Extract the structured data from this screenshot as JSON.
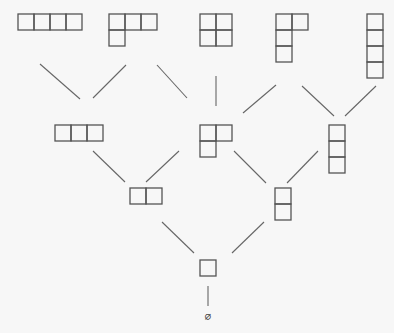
{
  "diagram": {
    "cell_size": 16,
    "colors": {
      "background": "#f7f7f7",
      "cell_stroke": "#555555",
      "edge_stroke": "#666666"
    },
    "nodes": [
      {
        "id": "p4",
        "partition": [
          4
        ],
        "label": "(4)",
        "x": 18,
        "y": 14
      },
      {
        "id": "p31",
        "partition": [
          3,
          1
        ],
        "label": "(3,1)",
        "x": 109,
        "y": 14
      },
      {
        "id": "p22",
        "partition": [
          2,
          2
        ],
        "label": "(2,2)",
        "x": 200,
        "y": 14
      },
      {
        "id": "p211",
        "partition": [
          2,
          1,
          1
        ],
        "label": "(2,1,1)",
        "x": 276,
        "y": 14
      },
      {
        "id": "p1111",
        "partition": [
          1,
          1,
          1,
          1
        ],
        "label": "(1,1,1,1)",
        "x": 367,
        "y": 14
      },
      {
        "id": "p3",
        "partition": [
          3
        ],
        "label": "(3)",
        "x": 55,
        "y": 125
      },
      {
        "id": "p21",
        "partition": [
          2,
          1
        ],
        "label": "(2,1)",
        "x": 200,
        "y": 125
      },
      {
        "id": "p111",
        "partition": [
          1,
          1,
          1
        ],
        "label": "(1,1,1)",
        "x": 329,
        "y": 125
      },
      {
        "id": "p2",
        "partition": [
          2
        ],
        "label": "(2)",
        "x": 130,
        "y": 188
      },
      {
        "id": "p11",
        "partition": [
          1,
          1
        ],
        "label": "(1,1)",
        "x": 275,
        "y": 188
      },
      {
        "id": "p1",
        "partition": [
          1
        ],
        "label": "(1)",
        "x": 200,
        "y": 260
      }
    ],
    "edges": [
      {
        "from": "p3",
        "to": "p4",
        "x1": 80,
        "y1": 99,
        "x2": 40,
        "y2": 64
      },
      {
        "from": "p3",
        "to": "p31",
        "x1": 93,
        "y1": 98,
        "x2": 126,
        "y2": 65
      },
      {
        "from": "p21",
        "to": "p31",
        "x1": 187,
        "y1": 98,
        "x2": 157,
        "y2": 65
      },
      {
        "from": "p21",
        "to": "p22",
        "x1": 216,
        "y1": 106,
        "x2": 216,
        "y2": 76
      },
      {
        "from": "p21",
        "to": "p211",
        "x1": 243,
        "y1": 113,
        "x2": 276,
        "y2": 85
      },
      {
        "from": "p111",
        "to": "p211",
        "x1": 334,
        "y1": 116,
        "x2": 302,
        "y2": 86
      },
      {
        "from": "p111",
        "to": "p1111",
        "x1": 345,
        "y1": 116,
        "x2": 376,
        "y2": 86
      },
      {
        "from": "p2",
        "to": "p3",
        "x1": 125,
        "y1": 182,
        "x2": 93,
        "y2": 151
      },
      {
        "from": "p2",
        "to": "p21",
        "x1": 146,
        "y1": 182,
        "x2": 179,
        "y2": 151
      },
      {
        "from": "p11",
        "to": "p21",
        "x1": 266,
        "y1": 183,
        "x2": 234,
        "y2": 151
      },
      {
        "from": "p11",
        "to": "p111",
        "x1": 287,
        "y1": 183,
        "x2": 318,
        "y2": 151
      },
      {
        "from": "p1",
        "to": "p2",
        "x1": 194,
        "y1": 253,
        "x2": 162,
        "y2": 222
      },
      {
        "from": "p1",
        "to": "p11",
        "x1": 232,
        "y1": 253,
        "x2": 264,
        "y2": 222
      },
      {
        "from": "empty",
        "to": "p1",
        "x1": 208,
        "y1": 306,
        "x2": 208,
        "y2": 286
      }
    ],
    "empty_set": {
      "label": "∅",
      "x": 208,
      "y": 320
    }
  }
}
